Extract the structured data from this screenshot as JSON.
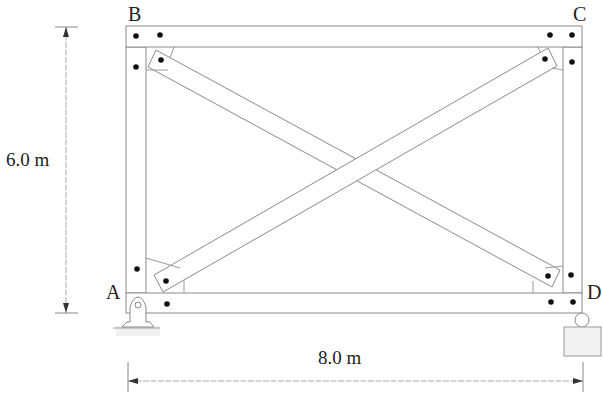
{
  "diagram": {
    "nodes": [
      {
        "id": "A",
        "label": "A",
        "support": "pin"
      },
      {
        "id": "B",
        "label": "B",
        "support": "none"
      },
      {
        "id": "C",
        "label": "C",
        "support": "none"
      },
      {
        "id": "D",
        "label": "D",
        "support": "roller"
      }
    ],
    "members": [
      {
        "from": "A",
        "to": "B",
        "type": "column"
      },
      {
        "from": "B",
        "to": "C",
        "type": "beam"
      },
      {
        "from": "C",
        "to": "D",
        "type": "column"
      },
      {
        "from": "A",
        "to": "D",
        "type": "beam"
      },
      {
        "from": "A",
        "to": "C",
        "type": "diagonal-brace"
      },
      {
        "from": "B",
        "to": "D",
        "type": "diagonal-brace"
      }
    ],
    "dimensions": {
      "height": "6.0 m",
      "width": "8.0 m"
    }
  },
  "labels": {
    "A": "A",
    "B": "B",
    "C": "C",
    "D": "D",
    "height": "6.0 m",
    "width": "8.0 m"
  }
}
